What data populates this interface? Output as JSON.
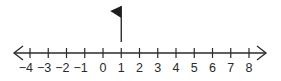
{
  "diagram": {
    "type": "number-line",
    "min": -4,
    "max": 8,
    "step": 1,
    "tick_labels": [
      "−4",
      "−3",
      "−2",
      "−1",
      "0",
      "1",
      "2",
      "3",
      "4",
      "5",
      "6",
      "7",
      "8"
    ],
    "tick_values": [
      -4,
      -3,
      -2,
      -1,
      0,
      1,
      2,
      3,
      4,
      5,
      6,
      7,
      8
    ],
    "arrows": [
      "left",
      "right"
    ],
    "marker": {
      "type": "flag",
      "value": 1,
      "direction": "left"
    },
    "colors": {
      "line": "#2a2a2a",
      "flag": "#1e1e1e",
      "background": "#ffffff"
    }
  }
}
